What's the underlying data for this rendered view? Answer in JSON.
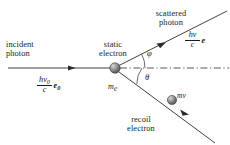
{
  "figure": {
    "width": 230,
    "height": 145,
    "background": "#ffffff",
    "stroke_color": "#2b2b2b"
  },
  "labels": {
    "incident_line1": "incident",
    "incident_line2": "photon",
    "static_line1": "static",
    "static_line2": "electron",
    "scattered_line1": "scattered",
    "scattered_line2": "photon",
    "recoil_line1": "recoil",
    "recoil_line2": "electron",
    "electron_mass": "m",
    "electron_mass_sub": "e",
    "recoil_momentum": "mv",
    "angle_phi": "φ",
    "angle_theta": "θ"
  },
  "momenta": {
    "incident": {
      "numerator": "hν",
      "numerator_sub": "0",
      "denominator": "c",
      "unit_vector": "e",
      "unit_vector_sub": "0"
    },
    "scattered": {
      "numerator": "hν",
      "denominator": "c",
      "unit_vector": "e",
      "unit_vector_sub": ""
    }
  },
  "spheres": {
    "static_electron": {
      "cx": 115,
      "cy": 68,
      "r": 5.2
    },
    "recoil_electron": {
      "cx": 172,
      "cy": 100,
      "r": 4.6
    }
  },
  "rays": {
    "incident": {
      "x1": 8,
      "y1": 68,
      "x2": 110,
      "y2": 68,
      "arrow_at": [
        73,
        68
      ],
      "style": "solid"
    },
    "axis": {
      "x1": 120,
      "y1": 68,
      "x2": 229,
      "y2": 68,
      "style": "dash-dot"
    },
    "scattered": {
      "x1": 118,
      "y1": 66,
      "x2": 226,
      "y2": 12,
      "arrow_at": [
        163,
        44
      ],
      "style": "solid"
    },
    "recoil": {
      "x1": 118,
      "y1": 71,
      "x2": 214,
      "y2": 142,
      "arrow_at": [
        186,
        112
      ],
      "style": "solid"
    }
  },
  "angle_arcs": {
    "phi": {
      "radius": 30,
      "from_deg": 0,
      "to_deg": 27
    },
    "theta": {
      "radius": 27,
      "from_deg": 0,
      "to_deg": -36
    }
  }
}
